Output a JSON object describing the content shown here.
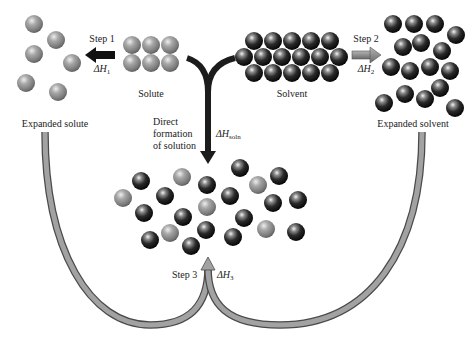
{
  "colors": {
    "solute_particle": "#8f8f8f",
    "solvent_particle": "#1c1c1c",
    "step1_arrow": "#111111",
    "step2_arrow": "#8a8a8a",
    "direct_arrow": "#1c1c1c",
    "step3_arrow": "#9a9a9a",
    "outline": "#4a4a4a"
  },
  "labels": {
    "step1": "Step 1",
    "dh1_delta": "ΔH",
    "dh1_sub": "1",
    "step2": "Step 2",
    "dh2_delta": "ΔH",
    "dh2_sub": "2",
    "step3": "Step 3",
    "dh3_delta": "ΔH",
    "dh3_sub": "3",
    "solute": "Solute",
    "solvent": "Solvent",
    "expanded_solute": "Expanded solute",
    "expanded_solvent": "Expanded solvent",
    "direct_line1": "Direct",
    "direct_line2": "formation",
    "direct_line3": "of solution",
    "dhsoln_delta": "ΔH",
    "dhsoln_sub": "soln"
  },
  "particles": {
    "radius": 9,
    "solute": [
      [
        132,
        45
      ],
      [
        151,
        45
      ],
      [
        170,
        45
      ],
      [
        132,
        63
      ],
      [
        151,
        63
      ],
      [
        170,
        63
      ]
    ],
    "solvent": [
      [
        254,
        41
      ],
      [
        273,
        41
      ],
      [
        292,
        41
      ],
      [
        311,
        41
      ],
      [
        330,
        41
      ],
      [
        244,
        57
      ],
      [
        263,
        57
      ],
      [
        282,
        57
      ],
      [
        301,
        57
      ],
      [
        320,
        57
      ],
      [
        339,
        57
      ],
      [
        254,
        73
      ],
      [
        273,
        73
      ],
      [
        292,
        73
      ],
      [
        311,
        73
      ],
      [
        330,
        73
      ]
    ],
    "expanded_solute": [
      [
        34,
        24
      ],
      [
        56,
        40
      ],
      [
        34,
        54
      ],
      [
        72,
        63
      ],
      [
        26,
        83
      ],
      [
        58,
        92
      ]
    ],
    "expanded_solvent": [
      [
        393,
        24
      ],
      [
        414,
        24
      ],
      [
        435,
        24
      ],
      [
        456,
        35
      ],
      [
        403,
        47
      ],
      [
        421,
        43
      ],
      [
        442,
        51
      ],
      [
        391,
        67
      ],
      [
        410,
        71
      ],
      [
        430,
        67
      ],
      [
        450,
        71
      ],
      [
        440,
        88
      ],
      [
        405,
        94
      ],
      [
        425,
        99
      ],
      [
        384,
        103
      ],
      [
        455,
        108
      ]
    ],
    "solution": [
      {
        "x": 123,
        "y": 198,
        "t": "g"
      },
      {
        "x": 141,
        "y": 181,
        "t": "d"
      },
      {
        "x": 182,
        "y": 177,
        "t": "g"
      },
      {
        "x": 165,
        "y": 196,
        "t": "d"
      },
      {
        "x": 207,
        "y": 185,
        "t": "d"
      },
      {
        "x": 144,
        "y": 213,
        "t": "d"
      },
      {
        "x": 183,
        "y": 217,
        "t": "d"
      },
      {
        "x": 207,
        "y": 207,
        "t": "g"
      },
      {
        "x": 230,
        "y": 196,
        "t": "d"
      },
      {
        "x": 240,
        "y": 168,
        "t": "d"
      },
      {
        "x": 258,
        "y": 185,
        "t": "g"
      },
      {
        "x": 279,
        "y": 176,
        "t": "d"
      },
      {
        "x": 273,
        "y": 203,
        "t": "d"
      },
      {
        "x": 298,
        "y": 200,
        "t": "d"
      },
      {
        "x": 244,
        "y": 218,
        "t": "d"
      },
      {
        "x": 266,
        "y": 229,
        "t": "g"
      },
      {
        "x": 296,
        "y": 232,
        "t": "d"
      },
      {
        "x": 233,
        "y": 237,
        "t": "d"
      },
      {
        "x": 170,
        "y": 233,
        "t": "g"
      },
      {
        "x": 150,
        "y": 240,
        "t": "d"
      },
      {
        "x": 206,
        "y": 230,
        "t": "d"
      },
      {
        "x": 191,
        "y": 246,
        "t": "d"
      }
    ]
  }
}
